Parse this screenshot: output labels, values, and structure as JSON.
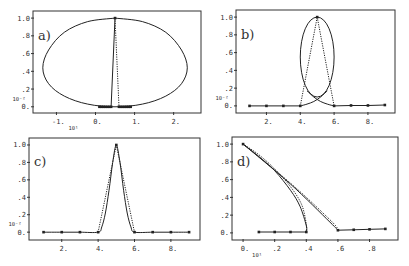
{
  "figure": {
    "panels": [
      {
        "id": "a",
        "label": "a)",
        "box": {
          "x0": 33,
          "y0": 11,
          "x1": 201,
          "y1": 113
        },
        "xlim": [
          -1.6,
          2.7
        ],
        "ylim": [
          -0.07,
          1.08
        ],
        "xticks": [
          {
            "v": -1,
            "label": "-1."
          },
          {
            "v": 0,
            "label": "0."
          },
          {
            "v": 1,
            "label": "1."
          },
          {
            "v": 2,
            "label": "2."
          }
        ],
        "yticks": [
          {
            "v": 0,
            "label": "0."
          },
          {
            "v": 0.2,
            "label": ".2"
          },
          {
            "v": 0.4,
            "label": ".4"
          },
          {
            "v": 0.6,
            "label": ".6"
          },
          {
            "v": 0.8,
            "label": ".8"
          },
          {
            "v": 1.0,
            "label": "1.0"
          }
        ],
        "x_scale_label": "10¹",
        "y_scale_label": "10⁻²",
        "closed_curve": [
          [
            0.5,
            1.0
          ],
          [
            1.2,
            0.96
          ],
          [
            1.8,
            0.84
          ],
          [
            2.2,
            0.64
          ],
          [
            2.35,
            0.44
          ],
          [
            2.2,
            0.26
          ],
          [
            1.8,
            0.12
          ],
          [
            1.2,
            0.03
          ],
          [
            0.5,
            0.0
          ],
          [
            -0.2,
            0.03
          ],
          [
            -0.8,
            0.12
          ],
          [
            -1.2,
            0.26
          ],
          [
            -1.35,
            0.44
          ],
          [
            -1.2,
            0.64
          ],
          [
            -0.8,
            0.84
          ],
          [
            -0.2,
            0.96
          ],
          [
            0.5,
            1.0
          ]
        ],
        "solid_line": [
          [
            0.4,
            0.0
          ],
          [
            0.5,
            1.0
          ]
        ],
        "dotted_line": [
          [
            0.5,
            1.0
          ],
          [
            0.6,
            0.0
          ]
        ],
        "markers": [
          [
            0.1,
            0
          ],
          [
            0.15,
            0
          ],
          [
            0.2,
            0
          ],
          [
            0.25,
            0
          ],
          [
            0.3,
            0
          ],
          [
            0.35,
            0
          ],
          [
            0.4,
            0
          ],
          [
            0.5,
            1.0
          ],
          [
            0.6,
            0
          ],
          [
            0.65,
            0
          ],
          [
            0.7,
            0
          ],
          [
            0.75,
            0
          ],
          [
            0.8,
            0
          ],
          [
            0.85,
            0
          ],
          [
            0.9,
            0
          ]
        ]
      },
      {
        "id": "b",
        "label": "b)",
        "box": {
          "x0": 236,
          "y0": 10,
          "x1": 395,
          "y1": 113
        },
        "xlim": [
          0.2,
          9.6
        ],
        "ylim": [
          -0.08,
          1.08
        ],
        "xticks": [
          {
            "v": 2,
            "label": "2."
          },
          {
            "v": 4,
            "label": "4."
          },
          {
            "v": 6,
            "label": "6."
          },
          {
            "v": 8,
            "label": "8."
          }
        ],
        "yticks": [
          {
            "v": 0,
            "label": "0."
          },
          {
            "v": 0.2,
            "label": ".2"
          },
          {
            "v": 0.4,
            "label": ".4"
          },
          {
            "v": 0.6,
            "label": ".6"
          },
          {
            "v": 0.8,
            "label": ".8"
          },
          {
            "v": 1.0,
            "label": "1.0"
          }
        ],
        "x_scale_label": "",
        "y_scale_label": "10⁻²",
        "ellipse": {
          "cx": 5.0,
          "cy": 0.55,
          "rx": 1.0,
          "ry": 0.45
        },
        "crossing_curve_left": [
          [
            4.0,
            0.0
          ],
          [
            4.4,
            0.02
          ],
          [
            4.8,
            0.05
          ],
          [
            5.2,
            0.1
          ],
          [
            5.6,
            0.17
          ]
        ],
        "crossing_curve_right": [
          [
            4.4,
            0.17
          ],
          [
            4.8,
            0.1
          ],
          [
            5.2,
            0.05
          ],
          [
            5.6,
            0.02
          ],
          [
            6.0,
            0.0
          ]
        ],
        "dotted_lines": [
          [
            [
              4.0,
              0.0
            ],
            [
              5.0,
              1.0
            ]
          ],
          [
            [
              5.0,
              1.0
            ],
            [
              6.0,
              0.0
            ]
          ]
        ],
        "baseline": [
          [
            1,
            0
          ],
          [
            2,
            0
          ],
          [
            3,
            0
          ],
          [
            4,
            0
          ],
          [
            6,
            0
          ],
          [
            7,
            0.005
          ],
          [
            8,
            0.005
          ],
          [
            9,
            0.01
          ]
        ],
        "markers": [
          [
            1,
            0
          ],
          [
            2,
            0
          ],
          [
            3,
            0
          ],
          [
            4,
            0
          ],
          [
            5,
            1.0
          ],
          [
            6,
            0
          ],
          [
            7,
            0.005
          ],
          [
            8,
            0.005
          ],
          [
            9,
            0.01
          ]
        ]
      },
      {
        "id": "c",
        "label": "c)",
        "box": {
          "x0": 29,
          "y0": 138,
          "x1": 200,
          "y1": 240
        },
        "xlim": [
          0.2,
          9.6
        ],
        "ylim": [
          -0.09,
          1.08
        ],
        "xticks": [
          {
            "v": 2,
            "label": "2."
          },
          {
            "v": 4,
            "label": "4."
          },
          {
            "v": 6,
            "label": "6."
          },
          {
            "v": 8,
            "label": "8."
          }
        ],
        "yticks": [
          {
            "v": 0,
            "label": "0."
          },
          {
            "v": 0.2,
            "label": ".2"
          },
          {
            "v": 0.4,
            "label": ".4"
          },
          {
            "v": 0.6,
            "label": ".6"
          },
          {
            "v": 0.8,
            "label": ".8"
          },
          {
            "v": 1.0,
            "label": "1.0"
          }
        ],
        "x_scale_label": "",
        "y_scale_label": "10⁻²",
        "solid_curve": [
          [
            1,
            0
          ],
          [
            2,
            0
          ],
          [
            3,
            0
          ],
          [
            4,
            0
          ],
          [
            4.2,
            0.06
          ],
          [
            4.4,
            0.22
          ],
          [
            4.6,
            0.48
          ],
          [
            4.8,
            0.8
          ],
          [
            5.0,
            1.0
          ],
          [
            5.2,
            0.8
          ],
          [
            5.4,
            0.48
          ],
          [
            5.6,
            0.22
          ],
          [
            5.8,
            0.06
          ],
          [
            6,
            0
          ],
          [
            7,
            0
          ],
          [
            8,
            0
          ],
          [
            9,
            0
          ]
        ],
        "dotted_curve": [
          [
            4,
            0
          ],
          [
            5,
            1.0
          ],
          [
            6,
            0
          ]
        ],
        "markers": [
          [
            1,
            0
          ],
          [
            2,
            0
          ],
          [
            3,
            0
          ],
          [
            4,
            0
          ],
          [
            5,
            1.0
          ],
          [
            6,
            0
          ],
          [
            7,
            0
          ],
          [
            8,
            0
          ],
          [
            9,
            0
          ]
        ]
      },
      {
        "id": "d",
        "label": "d)",
        "box": {
          "x0": 232,
          "y0": 137,
          "x1": 398,
          "y1": 240
        },
        "xlim": [
          -0.07,
          0.98
        ],
        "ylim": [
          -0.08,
          1.08
        ],
        "xticks": [
          {
            "v": 0,
            "label": "0."
          },
          {
            "v": 0.2,
            "label": ".2"
          },
          {
            "v": 0.4,
            "label": ".4"
          },
          {
            "v": 0.6,
            "label": ".6"
          },
          {
            "v": 0.8,
            "label": ".8"
          }
        ],
        "yticks": [
          {
            "v": 0,
            "label": "0."
          },
          {
            "v": 0.2,
            "label": ".2"
          },
          {
            "v": 0.4,
            "label": ".4"
          },
          {
            "v": 0.6,
            "label": ".6"
          },
          {
            "v": 0.8,
            "label": ".8"
          },
          {
            "v": 1.0,
            "label": "1.0"
          }
        ],
        "x_scale_label": "10¹",
        "y_scale_label": "",
        "left_solid": [
          [
            0.0,
            1.0
          ],
          [
            0.1,
            0.86
          ],
          [
            0.2,
            0.7
          ],
          [
            0.3,
            0.48
          ],
          [
            0.36,
            0.3
          ],
          [
            0.4,
            0.08
          ],
          [
            0.4,
            0.01
          ]
        ],
        "left_dotted": [
          [
            0.0,
            1.0
          ],
          [
            0.1,
            0.88
          ],
          [
            0.2,
            0.72
          ],
          [
            0.3,
            0.52
          ],
          [
            0.37,
            0.32
          ],
          [
            0.4,
            0.1
          ],
          [
            0.4,
            0.01
          ]
        ],
        "right_solid": [
          [
            0.0,
            1.0
          ],
          [
            0.3,
            0.55
          ],
          [
            0.55,
            0.12
          ],
          [
            0.6,
            0.03
          ]
        ],
        "right_dotted": [
          [
            0.0,
            1.0
          ],
          [
            0.3,
            0.56
          ],
          [
            0.56,
            0.13
          ],
          [
            0.6,
            0.03
          ]
        ],
        "bottom_left": [
          [
            0.1,
            0.01
          ],
          [
            0.2,
            0.01
          ],
          [
            0.3,
            0.01
          ],
          [
            0.4,
            0.01
          ]
        ],
        "bottom_right": [
          [
            0.6,
            0.03
          ],
          [
            0.7,
            0.035
          ],
          [
            0.8,
            0.04
          ],
          [
            0.9,
            0.045
          ]
        ],
        "markers": [
          [
            0.0,
            1.0
          ],
          [
            0.1,
            0.01
          ],
          [
            0.2,
            0.01
          ],
          [
            0.3,
            0.01
          ],
          [
            0.4,
            0.01
          ],
          [
            0.6,
            0.03
          ],
          [
            0.7,
            0.035
          ],
          [
            0.8,
            0.04
          ],
          [
            0.9,
            0.045
          ]
        ]
      }
    ]
  },
  "chart_data": [
    {
      "type": "line",
      "title": "a)",
      "xlabel": "x (×10¹)",
      "ylabel": "(×10⁻²)",
      "xlim": [
        -1.6,
        2.7
      ],
      "ylim": [
        0,
        1.0
      ],
      "x_ticks": [
        "-1.",
        "0.",
        "1.",
        "2."
      ],
      "y_ticks": [
        "0.",
        ".2",
        ".4",
        ".6",
        ".8",
        "1.0"
      ],
      "series": [
        {
          "name": "closed loop (solid)",
          "x": [
            0.5,
            1.2,
            1.8,
            2.2,
            2.35,
            2.2,
            1.8,
            1.2,
            0.5,
            -0.2,
            -0.8,
            -1.2,
            -1.35,
            -1.2,
            -0.8,
            -0.2,
            0.5
          ],
          "y": [
            1.0,
            0.96,
            0.84,
            0.64,
            0.44,
            0.26,
            0.12,
            0.03,
            0.0,
            0.03,
            0.12,
            0.26,
            0.44,
            0.64,
            0.84,
            0.96,
            1.0
          ]
        },
        {
          "name": "spike (solid)",
          "x": [
            0.4,
            0.5
          ],
          "y": [
            0.0,
            1.0
          ]
        },
        {
          "name": "spike (dotted)",
          "x": [
            0.5,
            0.6
          ],
          "y": [
            1.0,
            0.0
          ]
        },
        {
          "name": "sample points",
          "x": [
            0.1,
            0.15,
            0.2,
            0.25,
            0.3,
            0.35,
            0.4,
            0.5,
            0.6,
            0.65,
            0.7,
            0.75,
            0.8,
            0.85,
            0.9
          ],
          "y": [
            0,
            0,
            0,
            0,
            0,
            0,
            0,
            1.0,
            0,
            0,
            0,
            0,
            0,
            0,
            0
          ]
        }
      ],
      "grid": false
    },
    {
      "type": "line",
      "title": "b)",
      "xlim": [
        0.2,
        9.6
      ],
      "ylim": [
        0,
        1.0
      ],
      "x_ticks": [
        "2.",
        "4.",
        "6.",
        "8."
      ],
      "y_ticks": [
        "0.",
        ".2",
        ".4",
        ".6",
        ".8",
        "1.0"
      ],
      "ylabel": "(×10⁻²)",
      "series": [
        {
          "name": "ellipse loop (solid)",
          "center": [
            5.0,
            0.55
          ],
          "x_radius": 1.0,
          "y_radius": 0.45
        },
        {
          "name": "dotted triangle",
          "x": [
            4,
            5,
            6
          ],
          "y": [
            0,
            1.0,
            0
          ]
        },
        {
          "name": "sample points",
          "x": [
            1,
            2,
            3,
            4,
            5,
            6,
            7,
            8,
            9
          ],
          "y": [
            0,
            0,
            0,
            0,
            1.0,
            0,
            0.005,
            0.005,
            0.01
          ]
        }
      ],
      "grid": false
    },
    {
      "type": "line",
      "title": "c)",
      "xlim": [
        0.2,
        9.6
      ],
      "ylim": [
        0,
        1.0
      ],
      "x_ticks": [
        "2.",
        "4.",
        "6.",
        "8."
      ],
      "y_ticks": [
        "0.",
        ".2",
        ".4",
        ".6",
        ".8",
        "1.0"
      ],
      "ylabel": "(×10⁻²)",
      "series": [
        {
          "name": "smooth peak (solid)",
          "x": [
            1,
            2,
            3,
            4,
            4.2,
            4.4,
            4.6,
            4.8,
            5.0,
            5.2,
            5.4,
            5.6,
            5.8,
            6,
            7,
            8,
            9
          ],
          "y": [
            0,
            0,
            0,
            0,
            0.06,
            0.22,
            0.48,
            0.8,
            1.0,
            0.8,
            0.48,
            0.22,
            0.06,
            0,
            0,
            0,
            0
          ]
        },
        {
          "name": "linear peak (dotted)",
          "x": [
            4,
            5,
            6
          ],
          "y": [
            0,
            1.0,
            0
          ]
        },
        {
          "name": "sample points",
          "x": [
            1,
            2,
            3,
            4,
            5,
            6,
            7,
            8,
            9
          ],
          "y": [
            0,
            0,
            0,
            0,
            1.0,
            0,
            0,
            0,
            0
          ]
        }
      ],
      "grid": false
    },
    {
      "type": "line",
      "title": "d)",
      "xlim": [
        -0.07,
        0.98
      ],
      "ylim": [
        0,
        1.0
      ],
      "x_ticks": [
        "0.",
        ".2",
        ".4",
        ".6",
        ".8"
      ],
      "y_ticks": [
        "0.",
        ".2",
        ".4",
        ".6",
        ".8",
        "1.0"
      ],
      "xlabel": "(×10¹)",
      "series": [
        {
          "name": "left branch (solid)",
          "x": [
            0.0,
            0.1,
            0.2,
            0.3,
            0.36,
            0.4
          ],
          "y": [
            1.0,
            0.86,
            0.7,
            0.48,
            0.3,
            0.01
          ]
        },
        {
          "name": "right branch (solid)",
          "x": [
            0.0,
            0.3,
            0.55,
            0.6
          ],
          "y": [
            1.0,
            0.55,
            0.12,
            0.03
          ]
        },
        {
          "name": "bottom left",
          "x": [
            0.1,
            0.2,
            0.3,
            0.4
          ],
          "y": [
            0.01,
            0.01,
            0.01,
            0.01
          ]
        },
        {
          "name": "bottom right",
          "x": [
            0.6,
            0.7,
            0.8,
            0.9
          ],
          "y": [
            0.03,
            0.035,
            0.04,
            0.045
          ]
        }
      ],
      "grid": false
    }
  ]
}
